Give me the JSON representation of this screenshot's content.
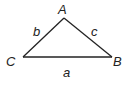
{
  "diagram": {
    "type": "triangle",
    "vertices": [
      {
        "id": "A",
        "label": "A"
      },
      {
        "id": "B",
        "label": "B"
      },
      {
        "id": "C",
        "label": "C"
      }
    ],
    "sides": [
      {
        "id": "a",
        "label": "a",
        "from": "C",
        "to": "B"
      },
      {
        "id": "b",
        "label": "b",
        "from": "C",
        "to": "A"
      },
      {
        "id": "c",
        "label": "c",
        "from": "A",
        "to": "B"
      }
    ],
    "colors": {
      "stroke": "#222222",
      "background": "#ffffff"
    }
  }
}
